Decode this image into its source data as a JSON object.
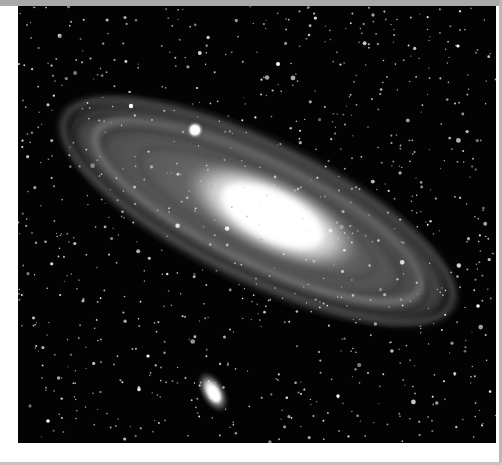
{
  "image": {
    "subject": "Andromeda galaxy (M31) with satellite galaxies M32 and M110",
    "style": "black-and-white astrophotograph",
    "colors": {
      "sky": "#030303",
      "core": "#ffffff",
      "disk": "#8a8a8a",
      "border_top": "#a9a9a9",
      "page": "#ffffff"
    },
    "frame": {
      "x": 18,
      "y": 6,
      "width": 478,
      "height": 437
    }
  }
}
